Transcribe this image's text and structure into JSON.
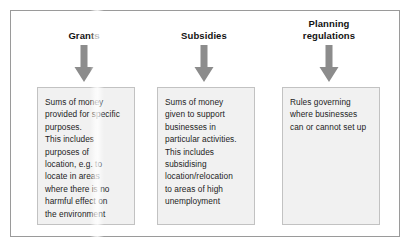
{
  "figure": {
    "columns": [
      {
        "title": "Grants",
        "title_lines": [
          "Grants"
        ],
        "arrow_icon": "arrow-down-icon",
        "arrow_color": "#8c8c8c",
        "box_text": "Sums of money\nprovided for specific\npurposes.\nThis includes\npurposes of\nlocation, e.g. to\nlocate in areas\nwhere there is no\nharmful effect on\nthe environment",
        "box_fill": "#f1f1f1",
        "box_border": "#c2c2c2"
      },
      {
        "title": "Subsidies",
        "title_lines": [
          "Subsidies"
        ],
        "arrow_icon": "arrow-down-icon",
        "arrow_color": "#8c8c8c",
        "box_text": "Sums of money\ngiven to support\nbusinesses in\nparticular activities.\nThis includes\nsubsidising\nlocation/relocation\nto areas of high\nunemployment",
        "box_fill": "#f1f1f1",
        "box_border": "#c2c2c2"
      },
      {
        "title": "Planning regulations",
        "title_lines": [
          "Planning",
          "regulations"
        ],
        "arrow_icon": "arrow-down-icon",
        "arrow_color": "#8c8c8c",
        "box_text": "Rules governing\nwhere businesses\ncan or cannot set up",
        "box_fill": "#f1f1f1",
        "box_border": "#c2c2c2"
      }
    ],
    "frame_border_color": "#9a9a9a",
    "background_color": "#ffffff",
    "text_color": "#1d1d1d"
  }
}
